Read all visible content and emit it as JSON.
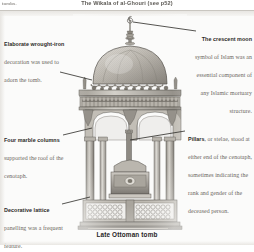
{
  "header": {
    "left_text": "tombs.",
    "center_text": "The Wikala of al-Ghouri (see p52)"
  },
  "annotations": [
    {
      "id": "wrought-iron",
      "lead": "Elaborate wrought-iron ",
      "body": "decoration was used to adorn the tomb."
    },
    {
      "id": "crescent-moon",
      "lead": "The crescent moon ",
      "body": "symbol of Islam was an essential component of any Islamic mortuary structure."
    },
    {
      "id": "marble-columns",
      "lead": "Four marble columns ",
      "body": "supported the roof of the cenotaph."
    },
    {
      "id": "pillars",
      "lead": "Pillars",
      "body": ", or stelae, stood at either end of the cenotaph, sometimes indicating the rank and gender of the deceased person."
    },
    {
      "id": "lattice",
      "lead": "Decorative lattice ",
      "body": "panelling was a frequent feature."
    }
  ],
  "caption": {
    "text": "Late Ottoman tomb"
  },
  "illustration": {
    "name": "late-ottoman-tomb-engraving",
    "ink": "#6f6b64",
    "ink_dark": "#4a4741",
    "ink_light": "#9a968e",
    "paper": "#fbfbfa"
  }
}
